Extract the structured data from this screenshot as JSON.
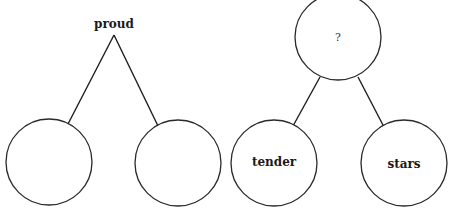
{
  "diagram": {
    "type": "tree-pair",
    "trees": [
      {
        "root": {
          "label": "proud",
          "shape": "text"
        },
        "children": [
          {
            "label": "",
            "shape": "circle"
          },
          {
            "label": "",
            "shape": "circle"
          }
        ]
      },
      {
        "root": {
          "label": "?",
          "shape": "circle"
        },
        "children": [
          {
            "label": "tender",
            "shape": "circle"
          },
          {
            "label": "stars",
            "shape": "circle"
          }
        ]
      }
    ]
  }
}
